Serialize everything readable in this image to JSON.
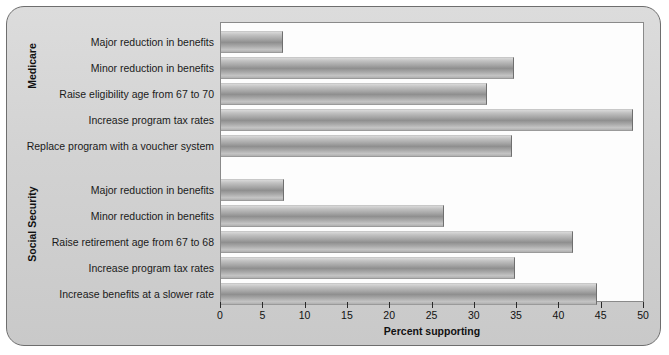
{
  "chart_data": {
    "type": "bar",
    "orientation": "horizontal",
    "title": "",
    "xlabel": "Percent supporting",
    "ylabel": "",
    "xlim": [
      0,
      50
    ],
    "xticks": [
      0,
      5,
      10,
      15,
      20,
      25,
      30,
      35,
      40,
      45,
      50
    ],
    "grid": false,
    "legend": null,
    "groups": [
      {
        "name": "Medicare",
        "categories": [
          "Major reduction in benefits",
          "Minor reduction in benefits",
          "Raise eligibility age from 67 to 70",
          "Increase program tax rates",
          "Replace program with a voucher system"
        ],
        "values": [
          7.3,
          34.6,
          31.5,
          48.7,
          34.4
        ]
      },
      {
        "name": "Social Security",
        "categories": [
          "Major reduction in benefits",
          "Minor reduction in benefits",
          "Raise retirement age from 67 to 68",
          "Increase program tax rates",
          "Increase benefits at a slower rate"
        ],
        "values": [
          7.4,
          26.4,
          41.6,
          34.7,
          44.5
        ]
      }
    ]
  },
  "axis": {
    "x_title": "Percent supporting",
    "tick_labels": [
      "0",
      "5",
      "10",
      "15",
      "20",
      "25",
      "30",
      "35",
      "40",
      "45",
      "50"
    ]
  },
  "groups": {
    "medicare_label": "Medicare",
    "social_security_label": "Social Security"
  },
  "colors": {
    "frame_border": "#6e6e6e",
    "frame_fill": "#d6d6d6",
    "plot_background": "#fdfdfd",
    "bar_mid": "#8f8f8f",
    "text": "#111111"
  }
}
